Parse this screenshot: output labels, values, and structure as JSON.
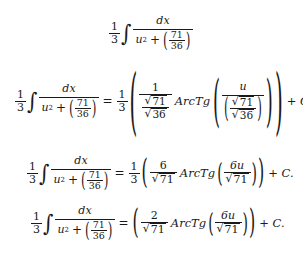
{
  "document": {
    "lines": [
      {
        "id": "line-1",
        "coef": {
          "num": "1",
          "den": "3"
        },
        "integral_sign": "∫",
        "integrand": {
          "num": "dx",
          "den_u": "u",
          "den_exp": "2",
          "plus": "+",
          "inner_num": "71",
          "inner_den": "36"
        }
      },
      {
        "id": "line-2",
        "coef": {
          "num": "1",
          "den": "3"
        },
        "integral_sign": "∫",
        "integrand": {
          "num": "dx",
          "den_u": "u",
          "den_exp": "2",
          "plus": "+",
          "inner_num": "71",
          "inner_den": "36"
        },
        "equals": "=",
        "rhs_coef": {
          "num": "1",
          "den": "3"
        },
        "outer_frac": {
          "num": "1",
          "den_num_radicand": "71",
          "den_den_radicand": "36"
        },
        "function": "ArcTg",
        "arg": {
          "num": "u",
          "den_num_radicand": "71",
          "den_den_radicand": "36"
        },
        "constant": "+ C."
      },
      {
        "id": "line-3",
        "coef": {
          "num": "1",
          "den": "3"
        },
        "integral_sign": "∫",
        "integrand": {
          "num": "dx",
          "den_u": "u",
          "den_exp": "2",
          "plus": "+",
          "inner_num": "71",
          "inner_den": "36"
        },
        "equals": "=",
        "rhs_coef": {
          "num": "1",
          "den": "3"
        },
        "outer_frac": {
          "num": "6",
          "den_radicand": "71"
        },
        "function": "ArcTg",
        "arg": {
          "num": "6u",
          "den_radicand": "71"
        },
        "constant": "+ C."
      },
      {
        "id": "line-4",
        "coef": {
          "num": "1",
          "den": "3"
        },
        "integral_sign": "∫",
        "integrand": {
          "num": "dx",
          "den_u": "u",
          "den_exp": "2",
          "plus": "+",
          "inner_num": "71",
          "inner_den": "36"
        },
        "equals": "=",
        "outer_frac": {
          "num": "2",
          "den_radicand": "71"
        },
        "function": "ArcTg",
        "arg": {
          "num": "6u",
          "den_radicand": "71"
        },
        "constant": "+ C."
      }
    ],
    "symbols": {
      "sqrt": "√",
      "lparen": "(",
      "rparen": ")"
    }
  }
}
